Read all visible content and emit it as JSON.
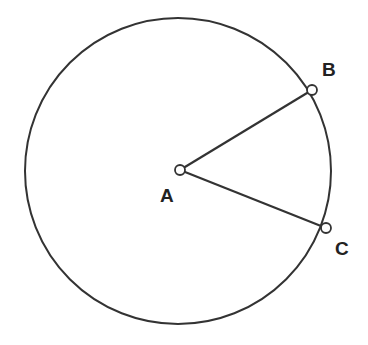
{
  "diagram": {
    "title": "",
    "circle": {
      "cx": 178,
      "cy": 171,
      "r": 153,
      "stroke": "#333333"
    },
    "points": [
      {
        "id": "A",
        "label": "A",
        "x": 180,
        "y": 170,
        "label_x": 160,
        "label_y": 202
      },
      {
        "id": "B",
        "label": "B",
        "x": 312,
        "y": 90,
        "label_x": 322,
        "label_y": 76
      },
      {
        "id": "C",
        "label": "C",
        "x": 326,
        "y": 228,
        "label_x": 335,
        "label_y": 255
      }
    ],
    "segments": [
      {
        "from": "A",
        "to": "B"
      },
      {
        "from": "A",
        "to": "C"
      }
    ]
  }
}
